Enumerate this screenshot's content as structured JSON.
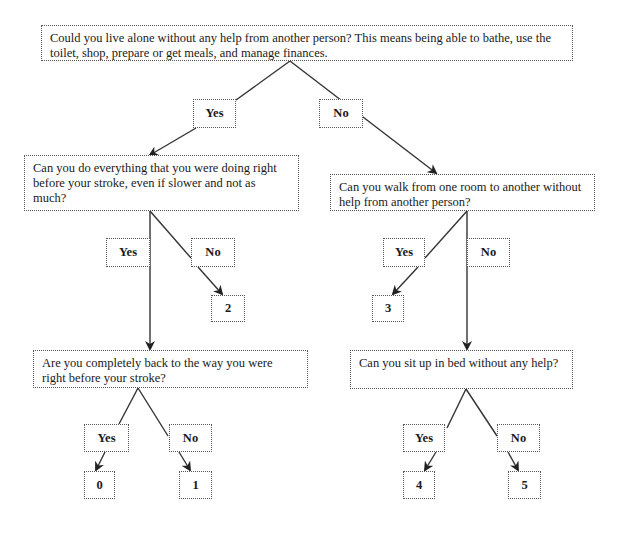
{
  "diagram": {
    "type": "decision-tree",
    "questions": {
      "q1": "Could you live alone without any help from another person? This means being able to bathe, use the toilet, shop, prepare or get meals, and manage finances.",
      "q2_yes": "Can you do everything that you were doing right before your stroke, even if slower and not as much?",
      "q2_no": "Can you walk from one room to another without help from another person?",
      "q3_yes": "Are you completely back to the way you were right before your stroke?",
      "q3_no": "Can you sit up in bed without any help?"
    },
    "labels": {
      "yes": "Yes",
      "no": "No"
    },
    "scores": {
      "s0": "0",
      "s1": "1",
      "s2": "2",
      "s3": "3",
      "s4": "4",
      "s5": "5"
    },
    "edges": [
      {
        "from": "q1",
        "to": "q2_yes",
        "label": "Yes"
      },
      {
        "from": "q1",
        "to": "q2_no",
        "label": "No"
      },
      {
        "from": "q2_yes",
        "to": "q3_yes",
        "label": "Yes"
      },
      {
        "from": "q2_yes",
        "to": "s2",
        "label": "No"
      },
      {
        "from": "q2_no",
        "to": "s3",
        "label": "Yes"
      },
      {
        "from": "q2_no",
        "to": "q3_no",
        "label": "No"
      },
      {
        "from": "q3_yes",
        "to": "s0",
        "label": "Yes"
      },
      {
        "from": "q3_yes",
        "to": "s1",
        "label": "No"
      },
      {
        "from": "q3_no",
        "to": "s4",
        "label": "Yes"
      },
      {
        "from": "q3_no",
        "to": "s5",
        "label": "No"
      }
    ]
  }
}
